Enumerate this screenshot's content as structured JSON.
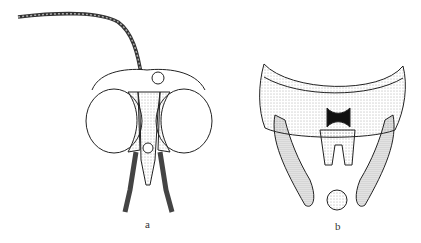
{
  "figure": {
    "panels": [
      {
        "label": "a",
        "subject": "insect head, frontal view"
      },
      {
        "label": "b",
        "subject": "male genitalia, ventral view"
      }
    ]
  }
}
